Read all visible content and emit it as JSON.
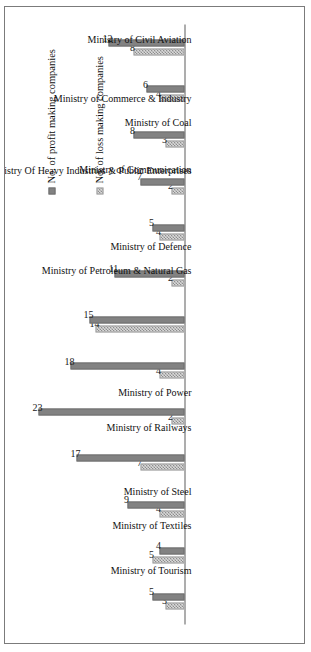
{
  "chart_data": {
    "type": "bar",
    "title": "",
    "subtitle": "",
    "xlabel": "",
    "ylabel": "",
    "orientation": "vertical-bars-rotated-90ccw",
    "grid": false,
    "legend_position": "bottom-right",
    "ylim": [
      0,
      24
    ],
    "categories": [
      "Ministry of Tourism",
      "Ministry of Textiles",
      "Ministry of Steel",
      "Ministry of Railways",
      "Ministry of Power",
      "Ministry of Petroleum & Natural Gas",
      "Ministry Of Heavy Industries & Public Enterprises",
      "Ministry of Defence",
      "Ministry of Communication",
      "Ministry of Commerce & Industry",
      "Ministry of Coal",
      "Ministry of Civil Aviation",
      "Ministry of Chemicals & Fertilizers"
    ],
    "series": [
      {
        "name": "No. of loss making companies",
        "color": "#d9d9d9",
        "pattern": "checkered",
        "values": [
          3,
          5,
          4,
          7,
          2,
          4,
          14,
          2,
          4,
          2,
          3,
          4,
          8
        ]
      },
      {
        "name": "No.  of profit making companies",
        "color": "#828282",
        "pattern": "solid",
        "values": [
          5,
          4,
          9,
          17,
          23,
          18,
          15,
          11,
          5,
          7,
          8,
          6,
          12
        ]
      }
    ],
    "data_labels": [
      {
        "category": "Ministry of Tourism",
        "loss": "3",
        "profit": "5"
      },
      {
        "category": "Ministry of Textiles",
        "loss": "5",
        "profit": "4"
      },
      {
        "category": "Ministry of Steel",
        "loss": "4",
        "profit": "9"
      },
      {
        "category": "Ministry of Railways",
        "loss": "7",
        "profit": "17"
      },
      {
        "category": "Ministry of Power",
        "loss": "2",
        "profit": "23"
      },
      {
        "category": "Ministry of Petroleum & Natural Gas",
        "loss": "4",
        "profit": "18"
      },
      {
        "category": "Ministry Of Heavy Industries & Public Enterprises",
        "loss": "14",
        "profit": "15"
      },
      {
        "category": "Ministry of Defence",
        "loss": "2",
        "profit": "11"
      },
      {
        "category": "Ministry of Communication",
        "loss": "4",
        "profit": "5"
      },
      {
        "category": "Ministry of Commerce & Industry",
        "loss": "2",
        "profit": "7"
      },
      {
        "category": "Ministry of Coal",
        "loss": "3",
        "profit": "8"
      },
      {
        "category": "Ministry of Civil Aviation",
        "loss": "4",
        "profit": "6"
      },
      {
        "category": "Ministry of Chemicals & Fertilizers",
        "loss": "8",
        "profit": "12"
      }
    ]
  },
  "legend": {
    "profit_label": "No.  of profit making companies",
    "loss_label": "No.  of loss making companies"
  }
}
